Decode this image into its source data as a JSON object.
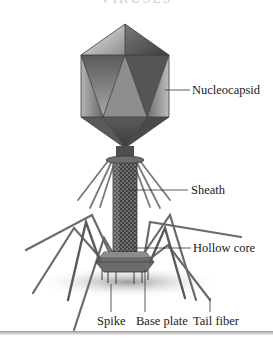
{
  "figure": {
    "title_partial": "VIRUSES",
    "labels": {
      "nucleocapsid": "Nucleocapsid",
      "sheath": "Sheath",
      "hollow_core": "Hollow core",
      "spike": "Spike",
      "base_plate": "Base plate",
      "tail_fiber": "Tail fiber"
    }
  },
  "colors": {
    "capsid_light": "#d8d8d8",
    "capsid_mid": "#8a8a8a",
    "capsid_dark": "#4a4a4a",
    "leader_line": "#333333",
    "label_text": "#1a1a1a"
  }
}
